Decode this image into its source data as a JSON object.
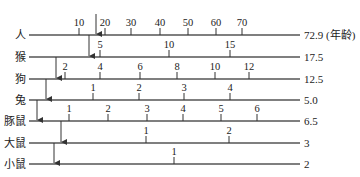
{
  "diagram": {
    "type": "species-age-comparison-timelines",
    "line_x_start": 29,
    "line_x_end": 300,
    "rows": [
      {
        "species": "人",
        "y": 35,
        "end_label": "72.9 (年龄)",
        "arrow_x": 96,
        "arrow_from_y": 14,
        "ticks": [
          {
            "label": "10",
            "x": 79
          },
          {
            "label": "20",
            "x": 105
          },
          {
            "label": "30",
            "x": 131
          },
          {
            "label": "40",
            "x": 160
          },
          {
            "label": "50",
            "x": 188
          },
          {
            "label": "60",
            "x": 216
          },
          {
            "label": "70",
            "x": 242
          }
        ],
        "tick_dir": "up"
      },
      {
        "species": "猴",
        "y": 57,
        "end_label": "17.5",
        "arrow_x": 89,
        "arrow_from_y": 35,
        "ticks": [
          {
            "label": "5",
            "x": 100
          },
          {
            "label": "10",
            "x": 169
          },
          {
            "label": "15",
            "x": 230
          }
        ],
        "tick_dir": "up"
      },
      {
        "species": "狗",
        "y": 79,
        "end_label": "12.5",
        "arrow_x": 56,
        "arrow_from_y": 57,
        "ticks": [
          {
            "label": "2",
            "x": 65
          },
          {
            "label": "4",
            "x": 100
          },
          {
            "label": "6",
            "x": 140
          },
          {
            "label": "8",
            "x": 177
          },
          {
            "label": "10",
            "x": 215
          },
          {
            "label": "12",
            "x": 249
          }
        ],
        "tick_dir": "up"
      },
      {
        "species": "兔",
        "y": 100,
        "end_label": "5.0",
        "arrow_x": 46,
        "arrow_from_y": 79,
        "ticks": [
          {
            "label": "1",
            "x": 93
          },
          {
            "label": "2",
            "x": 139
          },
          {
            "label": "3",
            "x": 184
          },
          {
            "label": "4",
            "x": 230
          }
        ],
        "tick_dir": "up"
      },
      {
        "species": "豚鼠",
        "y": 121,
        "end_label": "6.5",
        "arrow_x": 37,
        "arrow_from_y": 100,
        "ticks": [
          {
            "label": "1",
            "x": 69
          },
          {
            "label": "2",
            "x": 108
          },
          {
            "label": "3",
            "x": 147
          },
          {
            "label": "4",
            "x": 183
          },
          {
            "label": "5",
            "x": 221
          },
          {
            "label": "6",
            "x": 257
          }
        ],
        "tick_dir": "up"
      },
      {
        "species": "大鼠",
        "y": 143,
        "end_label": "3",
        "arrow_x": 61,
        "arrow_from_y": 121,
        "ticks": [
          {
            "label": "1",
            "x": 146
          },
          {
            "label": "2",
            "x": 229
          }
        ],
        "tick_dir": "up"
      },
      {
        "species": "小鼠",
        "y": 164,
        "end_label": "2",
        "arrow_x": 54,
        "arrow_from_y": 143,
        "ticks": [
          {
            "label": "1",
            "x": 174
          }
        ],
        "tick_dir": "up"
      }
    ],
    "colors": {
      "line": "#555555",
      "text": "#222222"
    }
  }
}
